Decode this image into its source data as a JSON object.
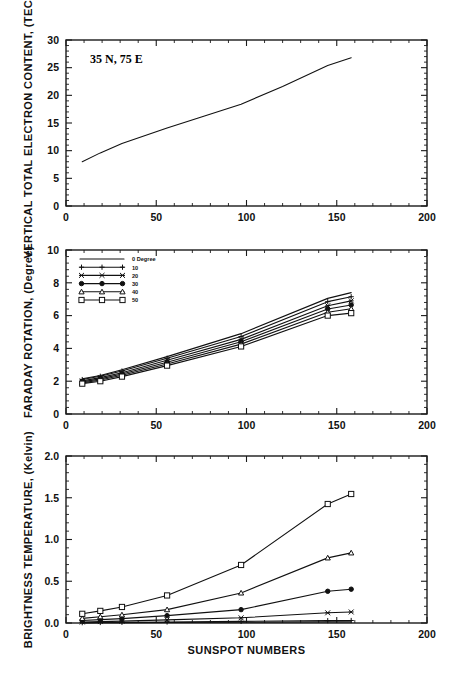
{
  "figure": {
    "annotation": "35 N, 75 E",
    "xlabel": "SUNSPOT NUMBERS"
  },
  "legend": {
    "title_suffix": "Degree",
    "entries": [
      {
        "label": "0  Degree",
        "marker": "none"
      },
      {
        "label": "10",
        "marker": "plus"
      },
      {
        "label": "20",
        "marker": "asterisk"
      },
      {
        "label": "30",
        "marker": "circle-filled"
      },
      {
        "label": "40",
        "marker": "triangle"
      },
      {
        "label": "50",
        "marker": "square"
      }
    ]
  },
  "chart_data": [
    {
      "type": "line",
      "panel": "top",
      "title": "35 N, 75 E",
      "xlabel": "",
      "ylabel": "VERTICAL TOTAL ELECTRON CONTENT, (TECU)",
      "xlim": [
        0,
        200
      ],
      "ylim": [
        0,
        30
      ],
      "xticks": [
        0,
        50,
        100,
        150,
        200
      ],
      "yticks": [
        0,
        5,
        10,
        15,
        20,
        25,
        30
      ],
      "xtick_labels": [
        "0",
        "50",
        "100",
        "150",
        "200"
      ],
      "ytick_labels": [
        "0",
        "5",
        "10",
        "15",
        "20",
        "25",
        "30"
      ],
      "grid": false,
      "legend_position": "none",
      "x": [
        9,
        19,
        31,
        56,
        75,
        97,
        120,
        145,
        158
      ],
      "values": [
        8.0,
        9.6,
        11.3,
        14.1,
        16.1,
        18.4,
        21.6,
        25.4,
        26.8
      ],
      "series": [
        {
          "name": "VTEC",
          "marker": "none",
          "values": [
            8.0,
            9.6,
            11.3,
            14.1,
            16.1,
            18.4,
            21.6,
            25.4,
            26.8
          ]
        }
      ]
    },
    {
      "type": "line",
      "panel": "middle",
      "title": "",
      "xlabel": "",
      "ylabel": "FARADAY ROTATION, (Degree)",
      "xlim": [
        0,
        200
      ],
      "ylim": [
        0,
        10
      ],
      "xticks": [
        0,
        50,
        100,
        150,
        200
      ],
      "yticks": [
        0,
        2,
        4,
        6,
        8,
        10
      ],
      "xtick_labels": [
        "0",
        "50",
        "100",
        "150",
        "200"
      ],
      "ytick_labels": [
        "0",
        "2",
        "4",
        "6",
        "8",
        "10"
      ],
      "grid": false,
      "legend_position": "upper left",
      "x": [
        9,
        19,
        31,
        56,
        97,
        145,
        158
      ],
      "series": [
        {
          "name": "0",
          "marker": "none",
          "values": [
            2.15,
            2.35,
            2.7,
            3.5,
            4.9,
            7.05,
            7.4
          ]
        },
        {
          "name": "10",
          "marker": "plus",
          "values": [
            2.1,
            2.3,
            2.62,
            3.4,
            4.72,
            6.85,
            7.15
          ]
        },
        {
          "name": "20",
          "marker": "asterisk",
          "values": [
            2.02,
            2.22,
            2.52,
            3.28,
            4.55,
            6.6,
            6.9
          ]
        },
        {
          "name": "30",
          "marker": "circle-filled",
          "values": [
            1.96,
            2.14,
            2.44,
            3.16,
            4.4,
            6.4,
            6.65
          ]
        },
        {
          "name": "40",
          "marker": "triangle",
          "values": [
            1.9,
            2.07,
            2.36,
            3.05,
            4.26,
            6.2,
            6.42
          ]
        },
        {
          "name": "50",
          "marker": "square",
          "values": [
            1.85,
            2.0,
            2.28,
            2.95,
            4.12,
            6.0,
            6.15
          ]
        }
      ]
    },
    {
      "type": "line",
      "panel": "bottom",
      "title": "",
      "xlabel": "SUNSPOT NUMBERS",
      "ylabel": "BRIGHTNESS TEMPERATURE, (Kelvin)",
      "xlim": [
        0,
        200
      ],
      "ylim": [
        0.0,
        2.0
      ],
      "xticks": [
        0,
        50,
        100,
        150,
        200
      ],
      "yticks": [
        0.0,
        0.5,
        1.0,
        1.5,
        2.0
      ],
      "xtick_labels": [
        "0",
        "50",
        "100",
        "150",
        "200"
      ],
      "ytick_labels": [
        "0.0",
        "0.5",
        "1.0",
        "1.5",
        "2.0"
      ],
      "grid": false,
      "legend_position": "none",
      "x": [
        9,
        19,
        31,
        56,
        97,
        145,
        158
      ],
      "series": [
        {
          "name": "0",
          "marker": "none",
          "values": [
            0.002,
            0.003,
            0.004,
            0.006,
            0.009,
            0.013,
            0.014
          ]
        },
        {
          "name": "10",
          "marker": "plus",
          "values": [
            0.004,
            0.006,
            0.008,
            0.012,
            0.019,
            0.028,
            0.03
          ]
        },
        {
          "name": "20",
          "marker": "asterisk",
          "values": [
            0.012,
            0.017,
            0.022,
            0.037,
            0.062,
            0.122,
            0.132
          ]
        },
        {
          "name": "30",
          "marker": "circle-filled",
          "values": [
            0.03,
            0.04,
            0.052,
            0.088,
            0.16,
            0.38,
            0.405
          ]
        },
        {
          "name": "40",
          "marker": "triangle",
          "values": [
            0.055,
            0.075,
            0.098,
            0.16,
            0.36,
            0.78,
            0.84
          ]
        },
        {
          "name": "50",
          "marker": "square",
          "values": [
            0.11,
            0.145,
            0.192,
            0.33,
            0.695,
            1.425,
            1.545
          ]
        }
      ]
    }
  ]
}
